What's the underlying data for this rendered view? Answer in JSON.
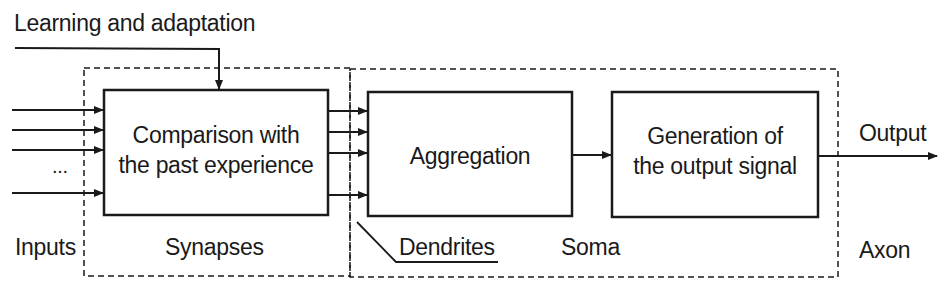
{
  "diagram": {
    "title_feedback": "Learning and adaptation",
    "blocks": [
      {
        "id": "comparison",
        "lines": [
          "Comparison with",
          "the past experience"
        ]
      },
      {
        "id": "aggregation",
        "lines": [
          "Aggregation"
        ]
      },
      {
        "id": "generation",
        "lines": [
          "Generation of",
          "the output signal"
        ]
      }
    ],
    "labels": {
      "inputs": "Inputs",
      "ellipsis": "...",
      "synapses": "Synapses",
      "dendrites": "Dendrites",
      "soma": "Soma",
      "output": "Output",
      "axon": "Axon"
    },
    "regions": [
      "Synapses",
      "Soma"
    ],
    "connections": [
      {
        "from": "inputs",
        "to": "comparison",
        "count": 4
      },
      {
        "from": "learning_and_adaptation",
        "to": "comparison"
      },
      {
        "from": "comparison",
        "to": "aggregation",
        "count": 4
      },
      {
        "from": "aggregation",
        "to": "generation"
      },
      {
        "from": "generation",
        "to": "output"
      }
    ],
    "colors": {
      "stroke": "#1a1a1a",
      "background": "#ffffff"
    }
  }
}
